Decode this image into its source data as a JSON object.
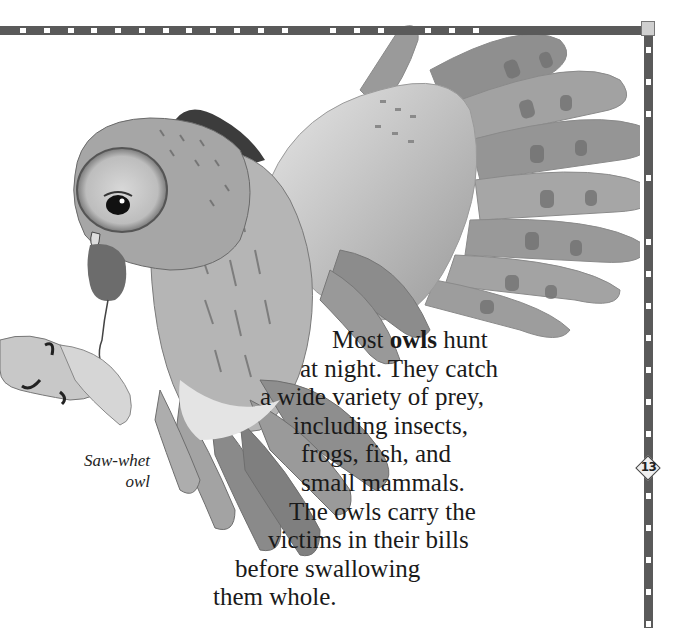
{
  "page": {
    "number": "13",
    "body_text": {
      "lines": [
        {
          "pre": "Most ",
          "bold": "owls",
          "post": " hunt",
          "indent": 42
        },
        {
          "text": "at night.  They catch",
          "indent": 10
        },
        {
          "text": "a wide variety of prey,",
          "indent": -30
        },
        {
          "text": "including insects,",
          "indent": 3
        },
        {
          "text": "frogs, fish, and",
          "indent": 11
        },
        {
          "text": "small mammals.",
          "indent": 11
        },
        {
          "text": "The owls carry the",
          "indent": -1
        },
        {
          "text": "victims in their bills",
          "indent": -22
        },
        {
          "text": "before swallowing",
          "indent": -55
        },
        {
          "text": "them whole.",
          "indent": -77
        }
      ]
    },
    "caption": {
      "lines": [
        "Saw-whet",
        "owl"
      ]
    }
  },
  "colors": {
    "frame": "#5a5a5a",
    "frame_tick": "#ffffff",
    "corner": "#cfcfcf",
    "text": "#1a1a1a"
  },
  "illustration": {
    "subject": "owl-in-flight-carrying-mouse"
  }
}
